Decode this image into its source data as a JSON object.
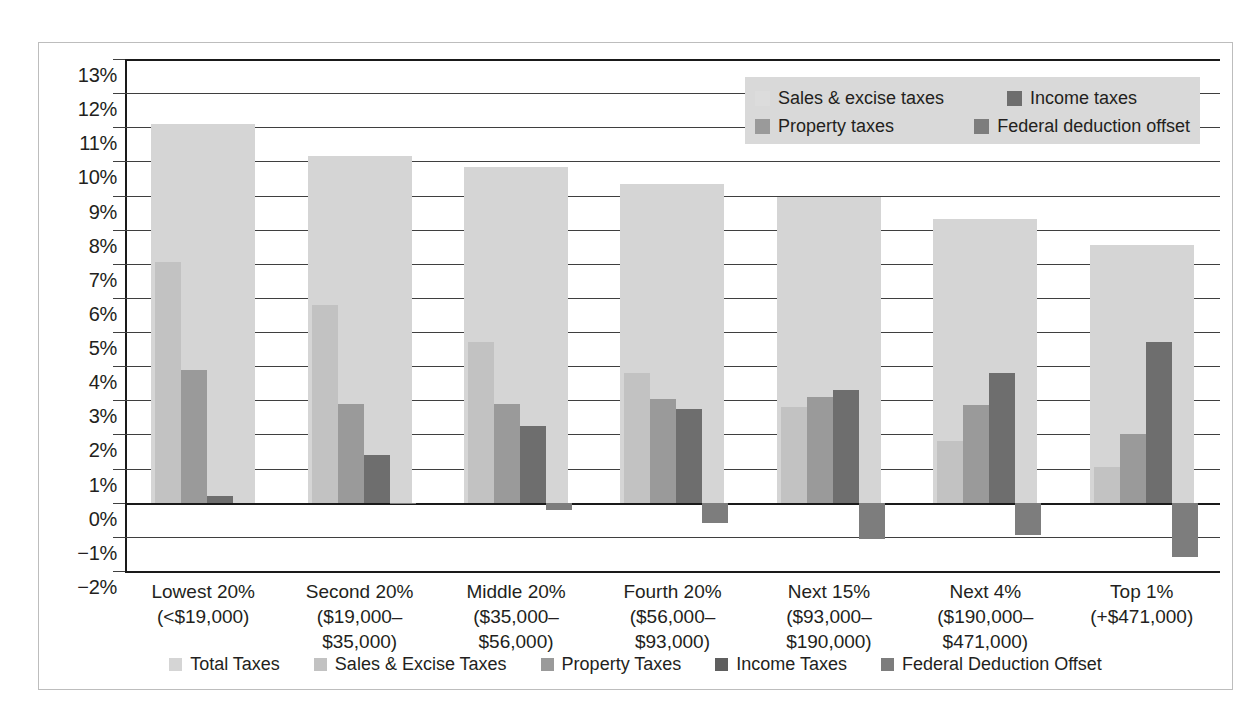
{
  "chart_data": {
    "type": "bar",
    "title": "",
    "subtitle": "",
    "xlabel": "",
    "ylabel": "",
    "ylim": [
      -2,
      13
    ],
    "ytick_step": 1,
    "grid": true,
    "legend_position": "top-right-inside-and-bottom",
    "categories": [
      "Lowest 20%",
      "Second 20%",
      "Middle 20%",
      "Fourth 20%",
      "Next 15%",
      "Next 4%",
      "Top 1%"
    ],
    "category_sublabels": [
      [
        "(<$19,000)",
        ""
      ],
      [
        "($19,000–",
        "$35,000)"
      ],
      [
        "($35,000–",
        "$56,000)"
      ],
      [
        "($56,000–",
        "$93,000)"
      ],
      [
        "($93,000–",
        "$190,000)"
      ],
      [
        "($190,000–",
        "$471,000)"
      ],
      [
        "(+$471,000)",
        ""
      ]
    ],
    "ytick_labels": [
      "13%",
      "12%",
      "11%",
      "10%",
      "9%",
      "8%",
      "7%",
      "6%",
      "5%",
      "4%",
      "3%",
      "2%",
      "1%",
      "0%",
      "−1%",
      "−2%"
    ],
    "ytick_values": [
      13,
      12,
      11,
      10,
      9,
      8,
      7,
      6,
      5,
      4,
      3,
      2,
      1,
      0,
      -1,
      -2
    ],
    "series": [
      {
        "name": "Total Taxes",
        "color": "#d5d5d5",
        "values": [
          11.1,
          10.15,
          9.85,
          9.35,
          8.95,
          8.3,
          7.55
        ]
      },
      {
        "name": "Sales & Excise Taxes",
        "color": "#c2c2c2",
        "values": [
          7.05,
          5.8,
          4.7,
          3.8,
          2.8,
          1.8,
          1.05
        ]
      },
      {
        "name": "Property Taxes",
        "color": "#9a9a9a",
        "values": [
          3.9,
          2.9,
          2.9,
          3.05,
          3.1,
          2.85,
          2.0
        ]
      },
      {
        "name": "Income Taxes",
        "color": "#6e6e6e",
        "values": [
          0.2,
          1.4,
          2.25,
          2.75,
          3.3,
          3.8,
          4.7
        ]
      },
      {
        "name": "Federal Deduction Offset",
        "color": "#7d7d7d",
        "values": [
          0.0,
          -0.05,
          -0.2,
          -0.6,
          -1.05,
          -0.95,
          -1.6
        ]
      }
    ]
  },
  "inner_legend": {
    "background": "#d9d9d9",
    "items": [
      {
        "label": "Sales & excise taxes",
        "color": "#dcdcdc"
      },
      {
        "label": "Income taxes",
        "color": "#6e6e6e"
      },
      {
        "label": "Property taxes",
        "color": "#9a9a9a"
      },
      {
        "label": "Federal deduction offset",
        "color": "#7d7d7d"
      }
    ]
  },
  "bottom_legend": {
    "items": [
      {
        "label": "Total Taxes",
        "color": "#d5d5d5"
      },
      {
        "label": "Sales & Excise Taxes",
        "color": "#c2c2c2"
      },
      {
        "label": "Property Taxes",
        "color": "#9a9a9a"
      },
      {
        "label": "Income Taxes",
        "color": "#5f5f5f"
      },
      {
        "label": "Federal Deduction Offset",
        "color": "#7d7d7d"
      }
    ]
  }
}
